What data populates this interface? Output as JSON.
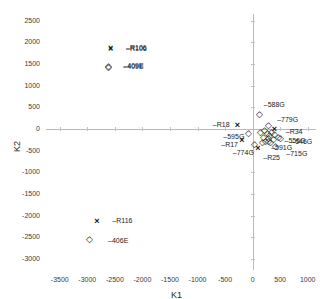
{
  "chart_data": {
    "type": "scatter",
    "title": "",
    "xlabel": "K1",
    "ylabel": "K2",
    "xlim": [
      -3750,
      1150
    ],
    "ylim": [
      -3250,
      2650
    ],
    "xticks": [
      -3500,
      -3000,
      -2500,
      -2000,
      -1500,
      -1000,
      -500,
      0,
      500,
      1000
    ],
    "yticks": [
      -3000,
      -2500,
      -2000,
      -1500,
      -1000,
      -500,
      0,
      500,
      1000,
      1500,
      2000,
      2500
    ],
    "grid": false,
    "axes_at_origin": true,
    "legend": {
      "position": "upper-center",
      "entries": [
        {
          "label": "R106",
          "marker": "x",
          "x": -2550,
          "y": 1850
        },
        {
          "label": "409E",
          "marker": "diamond",
          "x": -2600,
          "y": 1430
        }
      ]
    },
    "series": [
      {
        "name": "x-markers",
        "marker": "x",
        "points": [
          {
            "label": "R106",
            "x": -2550,
            "y": 1850,
            "label_dx": 14,
            "label_dy": -1
          },
          {
            "label": "R116",
            "x": -2800,
            "y": -2150,
            "label_dx": 14,
            "label_dy": -1
          },
          {
            "label": "R18",
            "x": -250,
            "y": 80,
            "label_dx": -26,
            "label_dy": -1
          },
          {
            "label": "R34",
            "x": 420,
            "y": -30,
            "label_dx": 10,
            "label_dy": 2
          },
          {
            "label": "R25",
            "x": 120,
            "y": -460,
            "label_dx": 4,
            "label_dy": 9
          },
          {
            "label": "R17",
            "x": -170,
            "y": -270,
            "label_dx": -22,
            "label_dy": 4
          }
        ]
      },
      {
        "name": "diamond-markers",
        "marker": "diamond",
        "points": [
          {
            "label": "409E",
            "x": -2600,
            "y": 1430,
            "label_dx": 14,
            "label_dy": -1
          },
          {
            "label": "406E",
            "x": -2950,
            "y": -2550,
            "label_dx": 18,
            "label_dy": 1
          },
          {
            "label": "588G",
            "x": 130,
            "y": 330,
            "label_dx": 4,
            "label_dy": -10
          },
          {
            "label": "779G",
            "x": 300,
            "y": 60,
            "label_dx": 8,
            "label_dy": -6
          },
          {
            "label": "595G",
            "x": -60,
            "y": -120,
            "label_dx": -26,
            "label_dy": 3
          },
          {
            "label": "774G",
            "x": 40,
            "y": -360,
            "label_dx": -22,
            "label_dy": 8
          },
          {
            "label": "715G",
            "x": 430,
            "y": -420,
            "label_dx": 10,
            "label_dy": 7
          },
          {
            "label": "546G",
            "x": 520,
            "y": -230,
            "label_dx": 10,
            "label_dy": 3
          },
          {
            "label": "556G",
            "x": 470,
            "y": -200,
            "label_dx": 6,
            "label_dy": 3
          },
          {
            "label": "591G",
            "x": 300,
            "y": -300,
            "label_dx": 2,
            "label_dy": 6
          },
          {
            "label": "cl1",
            "x": 230,
            "y": -40,
            "label_dx": 0,
            "label_dy": 0
          },
          {
            "label": "cl2",
            "x": 270,
            "y": -110,
            "label_dx": 0,
            "label_dy": 0
          },
          {
            "label": "cl3",
            "x": 320,
            "y": -170,
            "label_dx": 0,
            "label_dy": 0
          },
          {
            "label": "cl4",
            "x": 350,
            "y": -90,
            "label_dx": 0,
            "label_dy": 0
          },
          {
            "label": "cl5",
            "x": 200,
            "y": -200,
            "label_dx": 0,
            "label_dy": 0
          },
          {
            "label": "cl6",
            "x": 380,
            "y": -250,
            "label_dx": 0,
            "label_dy": 0
          },
          {
            "label": "cl7",
            "x": 160,
            "y": -90,
            "label_dx": 0,
            "label_dy": 0
          },
          {
            "label": "cl8",
            "x": 290,
            "y": -230,
            "label_dx": 0,
            "label_dy": 0
          },
          {
            "label": "cl9",
            "x": 240,
            "y": -290,
            "label_dx": 0,
            "label_dy": 0
          },
          {
            "label": "cl10",
            "x": 400,
            "y": -140,
            "label_dx": 0,
            "label_dy": 0
          },
          {
            "label": "cl11",
            "x": 180,
            "y": -330,
            "label_dx": 0,
            "label_dy": 0
          },
          {
            "label": "cl12",
            "x": 340,
            "y": -330,
            "label_dx": 0,
            "label_dy": 0
          }
        ]
      }
    ],
    "visible_labels": [
      "R106",
      "409E",
      "588G",
      "779G",
      "R34",
      "R18",
      "595G",
      "R17",
      "774G",
      "R25",
      "715G",
      "546G",
      "556G",
      "591G",
      "R116",
      "406E"
    ]
  },
  "markers": {
    "x_glyph": "×",
    "diamond_glyph": "◇",
    "x_icon_name": "cross-marker-icon",
    "diamond_icon_name": "diamond-marker-icon"
  },
  "style": {
    "axis_color": "#b9b9b9",
    "text_color": "#222222",
    "marker_color": "#111111",
    "background": "#ffffff"
  }
}
